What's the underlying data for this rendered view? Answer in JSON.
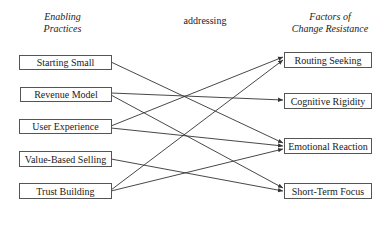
{
  "headers": {
    "left": "Enabling Practices",
    "left_line1": "Enabling",
    "left_line2": "Practices",
    "middle": "addressing",
    "right_line1": "Factors of",
    "right_line2": "Change Resistance"
  },
  "practices": [
    {
      "id": "starting-small",
      "label": "Starting Small"
    },
    {
      "id": "revenue-model",
      "label": "Revenue Model"
    },
    {
      "id": "user-experience",
      "label": "User Experience"
    },
    {
      "id": "value-based-selling",
      "label": "Value-Based Selling"
    },
    {
      "id": "trust-building",
      "label": "Trust Building"
    }
  ],
  "factors": [
    {
      "id": "routing-seeking",
      "label": "Routing Seeking"
    },
    {
      "id": "cognitive-rigidity",
      "label": "Cognitive Rigidity"
    },
    {
      "id": "emotional-reaction",
      "label": "Emotional Reaction"
    },
    {
      "id": "short-term-focus",
      "label": "Short-Term Focus"
    }
  ],
  "connections": [
    {
      "from": "Starting Small",
      "to": "Emotional Reaction"
    },
    {
      "from": "Revenue Model",
      "to": "Cognitive Rigidity"
    },
    {
      "from": "Revenue Model",
      "to": "Short-Term Focus"
    },
    {
      "from": "User Experience",
      "to": "Routing Seeking"
    },
    {
      "from": "User Experience",
      "to": "Emotional Reaction"
    },
    {
      "from": "Value-Based Selling",
      "to": "Short-Term Focus"
    },
    {
      "from": "Trust Building",
      "to": "Routing Seeking"
    },
    {
      "from": "Trust Building",
      "to": "Emotional Reaction"
    }
  ],
  "colors": {
    "line": "#333333",
    "border": "#555555",
    "background": "#ffffff"
  }
}
